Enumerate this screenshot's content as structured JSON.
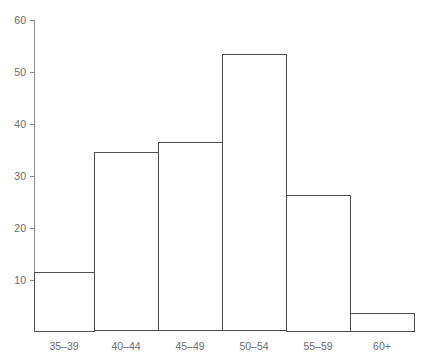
{
  "chart_data": {
    "type": "bar",
    "title": "",
    "subtitle": "",
    "xlabel": "",
    "ylabel": "",
    "categories": [
      "35–39",
      "40–44",
      "45–49",
      "50–54",
      "55–59",
      "60+"
    ],
    "values": [
      11.4,
      34.4,
      36.4,
      53.4,
      26.2,
      3.4
    ],
    "series": [
      {
        "name": "count",
        "values": [
          11.4,
          34.4,
          36.4,
          53.4,
          26.2,
          3.4
        ]
      }
    ],
    "ylim": [
      0,
      60
    ],
    "yticks": [
      10,
      20,
      30,
      40,
      50,
      60
    ],
    "ytick_labels": [
      "10",
      "20",
      "30",
      "40",
      "50",
      "60"
    ],
    "grid": false,
    "legend": false,
    "legend_position": "none",
    "bar_style": {
      "fill": "#ffffff",
      "stroke": "#4d4d4d",
      "gap": 0
    },
    "axis_color": "#8a8a8a",
    "text_color": "#6b6b6b",
    "background": "#ffffff"
  },
  "axes": {
    "y_axis_name": "y-axis",
    "x_axis_name": "x-axis"
  }
}
